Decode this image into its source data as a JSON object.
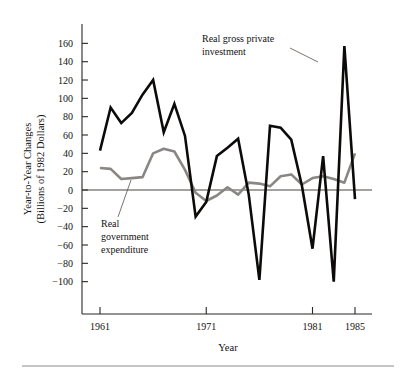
{
  "chart_data": {
    "type": "line",
    "title": "",
    "xlabel": "Year",
    "ylabel": "Year-to-Year Changes (Billions of 1982 Dollars)",
    "ylabel_line1": "Year-to-Year Changes",
    "ylabel_line2": "(Billions of 1982 Dollars)",
    "xlim": [
      1961,
      1985
    ],
    "ylim": [
      -100,
      160
    ],
    "grid": false,
    "legend": "annotations",
    "yticks": [
      160,
      140,
      120,
      100,
      80,
      60,
      40,
      20,
      0,
      -20,
      -40,
      -60,
      -80,
      -100
    ],
    "ytick_labels": [
      "160",
      "140",
      "120",
      "100",
      "80",
      "60",
      "40",
      "20",
      "0",
      "−20",
      "−40",
      "−60",
      "−80",
      "−100"
    ],
    "xticks": [
      1961,
      1971,
      1981,
      1985
    ],
    "xtick_labels": [
      "1961",
      "1971",
      "1981",
      "1985"
    ],
    "x": [
      1961,
      1962,
      1963,
      1964,
      1965,
      1966,
      1967,
      1968,
      1969,
      1970,
      1971,
      1972,
      1973,
      1974,
      1975,
      1976,
      1977,
      1978,
      1979,
      1980,
      1981,
      1982,
      1983,
      1984,
      1985
    ],
    "series": [
      {
        "name": "Real gross private investment",
        "color": "#0d0b0a",
        "values": [
          43,
          90,
          73,
          84,
          104,
          120,
          63,
          94,
          59,
          -29,
          -13,
          37,
          46,
          56,
          -5,
          -98,
          70,
          68,
          55,
          5,
          -64,
          37,
          -100,
          157,
          -10
        ]
      },
      {
        "name": "Real government expenditure",
        "color": "#8a8683",
        "values": [
          24,
          23,
          12,
          13,
          14,
          40,
          45,
          42,
          22,
          -3,
          -12,
          -6,
          3,
          -5,
          8,
          7,
          4,
          15,
          17,
          6,
          13,
          15,
          12,
          8,
          40
        ]
      }
    ],
    "annotations": [
      {
        "name": "real-gross-private-investment",
        "text_lines": [
          "Real gross private",
          "investment"
        ],
        "target_series": "Real gross private investment"
      },
      {
        "name": "real-government-expenditure",
        "text_lines": [
          "Real",
          "government",
          "expenditure"
        ],
        "target_series": "Real government expenditure"
      }
    ]
  },
  "figure": {
    "background_color": "#ffffff",
    "axis_color": "#2b2723",
    "footer_rule_color": "#8e8b88"
  }
}
